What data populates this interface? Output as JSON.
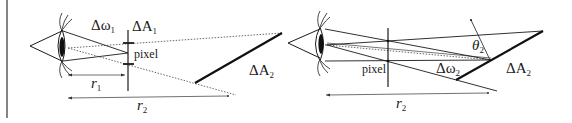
{
  "figure": {
    "left_panel": {
      "labels": {
        "solid_angle": "Δω",
        "solid_angle_sub": "1",
        "pixel_area": "ΔA",
        "pixel_area_sub": "1",
        "pixel": "pixel",
        "surface_area": "ΔA",
        "surface_area_sub": "2",
        "distance_near": "r",
        "distance_near_sub": "1",
        "distance_far": "r",
        "distance_far_sub": "2"
      }
    },
    "right_panel": {
      "labels": {
        "angle": "θ",
        "angle_sub": "2",
        "pixel": "pixel",
        "solid_angle": "Δω",
        "solid_angle_sub": "2",
        "surface_area": "ΔA",
        "surface_area_sub": "2",
        "distance": "r",
        "distance_sub": "2"
      }
    },
    "colors": {
      "line": "#1a1a1a",
      "background": "#ffffff"
    }
  }
}
